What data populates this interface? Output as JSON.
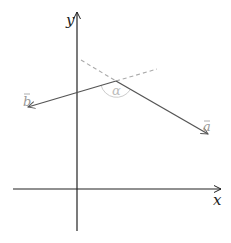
{
  "diagram": {
    "type": "vector-angle",
    "axes": {
      "x_label": "x",
      "y_label": "y",
      "color": "#222222"
    },
    "vectors": [
      {
        "name": "b",
        "label": "b",
        "tip": [
          28,
          107
        ]
      },
      {
        "name": "a",
        "label": "a",
        "tip": [
          208,
          134
        ]
      }
    ],
    "vertex": [
      116,
      81
    ],
    "angle": {
      "label": "α",
      "color": "#bbbbbb"
    },
    "colors": {
      "vector": "#555555",
      "dashed": "#aaaaaa",
      "label": "#999999",
      "arc": "#cccccc"
    }
  }
}
